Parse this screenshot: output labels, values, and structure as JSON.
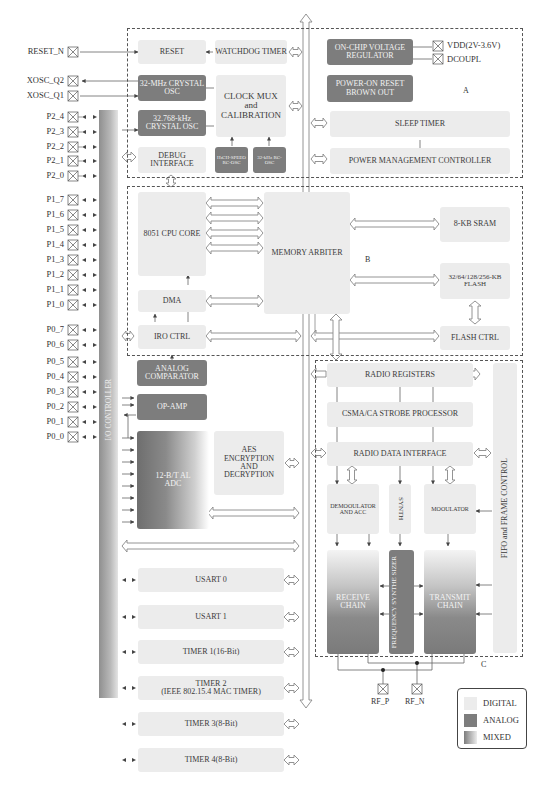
{
  "pins": {
    "reset": "RESET_N",
    "xosc_q2": "XOSC_Q2",
    "xosc_q1": "XOSC_Q1",
    "p2": [
      "P2_4",
      "P2_3",
      "P2_2",
      "P2_1",
      "P2_0"
    ],
    "p1": [
      "P1_7",
      "P1_6",
      "P1_5",
      "P1_4",
      "P1_3",
      "P1_2",
      "P1_1",
      "P1_0"
    ],
    "p0": [
      "P0_7",
      "P0_6",
      "P0_5",
      "P0_4",
      "P0_3",
      "P0_2",
      "P0_1",
      "P0_0"
    ],
    "vdd": "VDD(2V-3.6V)",
    "dcoupl": "DCOUPL",
    "rf_p": "RF_P",
    "rf_n": "RF_N"
  },
  "io_controller": "I/O CONTROLLER",
  "region_a": {
    "label": "A",
    "reset": "RESET",
    "watchdog": "WATCHDOG TIMER",
    "osc32m": "32-MHz CRYSTAL OSC",
    "osc32k": "32.768-kHz CRYSTAL OSC",
    "clock_mux": [
      "CLOCK MUX",
      "and",
      "CALIBRATION"
    ],
    "debug": "DEBUG INTERFACE",
    "hs_rc_osc": "HıCH-SPEEO RC-OSC",
    "rc_32k": "32-kHz RC-OSC",
    "regulator": "ON-CHIP VOLTAGE REGULATOR",
    "por": "POWER-ON RESET BROWN OUT",
    "sleep_timer": "SLEEP TIMER",
    "pmc": "POWER MANAGEMENT CONTROLLER"
  },
  "region_b": {
    "label": "B",
    "cpu": "8051 CPU CORE",
    "dma": "DMA",
    "irq": "IRO CTRL",
    "arbiter": "MEMORY ARBITER",
    "sram": "8-KB SRAM",
    "flash": "32/64/128/256-KB FLASH",
    "flash_ctrl": "FLASH CTRL"
  },
  "peripherals": {
    "comparator": "ANALOG COMPARATOR",
    "opamp": "OP-AMP",
    "adc": [
      "12-B/T AL",
      "ADC"
    ],
    "aes": "AES ENCRYPTION AND DECRYPTION",
    "usart0": "USART 0",
    "usart1": "USART 1",
    "timer1": "TIMER 1(16-Bit)",
    "timer2": [
      "TIMER 2",
      "(IEEE 802.15.4 MAC TIMER)"
    ],
    "timer3": "TIMER 3(8-Bit)",
    "timer4": "TIMER 4(8-Bit)"
  },
  "region_c": {
    "label": "C",
    "radio_registers": "RADIO REGISTERS",
    "csma": "CSMA/CA STROBE PROCESSOR",
    "radio_data": "RADIO DATA INTERFACE",
    "demod": "DEMOOULATOR AND ACC",
    "synth": "SYNTH",
    "mod": "MOOULATOR",
    "receive": "RECEIVE CHAIN",
    "freq_synth": "FREQUENCY SYNTHE SIZER",
    "transmit": "TRANSMIT CHAIN",
    "fifo": "FIFO and FRAME CONTROL"
  },
  "legend": {
    "items": [
      {
        "label": "DIGITAL",
        "color": "#ececec"
      },
      {
        "label": "ANALOG",
        "color": "#7d7d7d"
      },
      {
        "label": "MIXED",
        "color": "gradient"
      }
    ]
  },
  "colors": {
    "digital": "#ececec",
    "analog": "#7d7d7d",
    "line": "#555555"
  }
}
